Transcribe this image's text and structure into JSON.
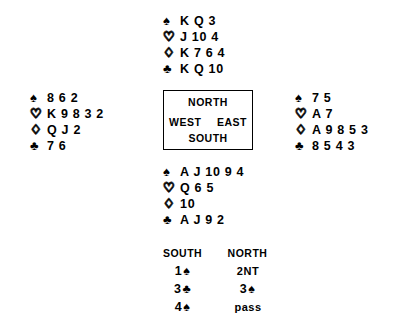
{
  "suit_symbols": {
    "spade": "♠",
    "heart": "♡",
    "diamond": "♢",
    "club": "♣"
  },
  "compass": {
    "north": "NORTH",
    "south": "SOUTH",
    "west": "WEST",
    "east": "EAST"
  },
  "hands": {
    "north": {
      "label": "NORTH",
      "spades": "K Q 3",
      "hearts": "J 10 4",
      "diamonds": "K 7 6 4",
      "clubs": "K Q 10"
    },
    "west": {
      "label": "WEST",
      "spades": "8 6 2",
      "hearts": "K 9 8 3 2",
      "diamonds": "Q J 2",
      "clubs": "7 6"
    },
    "east": {
      "label": "EAST",
      "spades": "7 5",
      "hearts": "A 7",
      "diamonds": "A 9 8 5 3",
      "clubs": "8 5 4 3"
    },
    "south": {
      "label": "SOUTH",
      "spades": "A J 10 9 4",
      "hearts": "Q 6 5",
      "diamonds": "10",
      "clubs": "A J 9 2"
    }
  },
  "auction": {
    "headers": {
      "south": "SOUTH",
      "north": "NORTH"
    },
    "rows": [
      {
        "south_level": "1",
        "south_suit": "♠",
        "south_text": "",
        "north_level": "",
        "north_suit": "",
        "north_text": "2NT"
      },
      {
        "south_level": "3",
        "south_suit": "♣",
        "south_text": "",
        "north_level": "3",
        "north_suit": "♠",
        "north_text": ""
      },
      {
        "south_level": "4",
        "south_suit": "♠",
        "south_text": "",
        "north_level": "",
        "north_suit": "",
        "north_text": "pass"
      }
    ]
  },
  "colors": {
    "ink": "#000000",
    "background": "#ffffff"
  }
}
